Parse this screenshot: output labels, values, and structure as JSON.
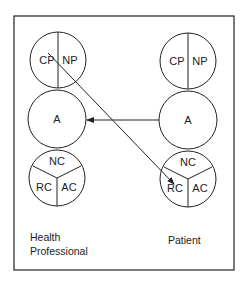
{
  "diagram": {
    "left_actor": {
      "caption_line1": "Health",
      "caption_line2": "Professional",
      "top_circle": {
        "left": "CP",
        "right": "NP"
      },
      "middle_circle": {
        "label": "A"
      },
      "bottom_circle": {
        "top": "NC",
        "left": "RC",
        "right": "AC"
      }
    },
    "right_actor": {
      "caption": "Patient",
      "top_circle": {
        "left": "CP",
        "right": "NP"
      },
      "middle_circle": {
        "label": "A"
      },
      "bottom_circle": {
        "top": "NC",
        "left": "RC",
        "right": "AC"
      }
    },
    "arrows": [
      {
        "from": "Patient A",
        "to": "Health Professional A"
      },
      {
        "from": "Health Professional CP",
        "to": "Patient RC"
      }
    ],
    "colors": {
      "stroke": "#222222",
      "background": "#ffffff"
    }
  }
}
